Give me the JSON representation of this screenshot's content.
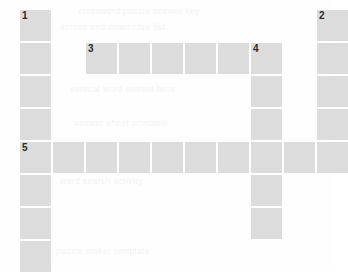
{
  "puzzle": {
    "title": "crossword-grid",
    "cell_fill_color": "#dcdcdc",
    "background_color": "#fefefe",
    "number_color": "#2b2b2b",
    "columns": 10,
    "rows": 8,
    "cell_size": 31,
    "cell_pitch": 33,
    "origin_x": 20,
    "origin_y": 10,
    "cells": [
      {
        "col": 0,
        "row": 0,
        "number": "1"
      },
      {
        "col": 9,
        "row": 0,
        "number": "2"
      },
      {
        "col": 0,
        "row": 1,
        "number": ""
      },
      {
        "col": 2,
        "row": 1,
        "number": "3"
      },
      {
        "col": 3,
        "row": 1,
        "number": ""
      },
      {
        "col": 4,
        "row": 1,
        "number": ""
      },
      {
        "col": 5,
        "row": 1,
        "number": ""
      },
      {
        "col": 6,
        "row": 1,
        "number": ""
      },
      {
        "col": 7,
        "row": 1,
        "number": "4"
      },
      {
        "col": 9,
        "row": 1,
        "number": ""
      },
      {
        "col": 0,
        "row": 2,
        "number": ""
      },
      {
        "col": 7,
        "row": 2,
        "number": ""
      },
      {
        "col": 9,
        "row": 2,
        "number": ""
      },
      {
        "col": 0,
        "row": 3,
        "number": ""
      },
      {
        "col": 7,
        "row": 3,
        "number": ""
      },
      {
        "col": 9,
        "row": 3,
        "number": ""
      },
      {
        "col": 0,
        "row": 4,
        "number": "5"
      },
      {
        "col": 1,
        "row": 4,
        "number": ""
      },
      {
        "col": 2,
        "row": 4,
        "number": ""
      },
      {
        "col": 3,
        "row": 4,
        "number": ""
      },
      {
        "col": 4,
        "row": 4,
        "number": ""
      },
      {
        "col": 5,
        "row": 4,
        "number": ""
      },
      {
        "col": 6,
        "row": 4,
        "number": ""
      },
      {
        "col": 7,
        "row": 4,
        "number": ""
      },
      {
        "col": 8,
        "row": 4,
        "number": ""
      },
      {
        "col": 9,
        "row": 4,
        "number": ""
      },
      {
        "col": 0,
        "row": 5,
        "number": ""
      },
      {
        "col": 7,
        "row": 5,
        "number": ""
      },
      {
        "col": 0,
        "row": 6,
        "number": ""
      },
      {
        "col": 7,
        "row": 6,
        "number": ""
      },
      {
        "col": 0,
        "row": 7,
        "number": ""
      }
    ]
  },
  "background_ghost_text": [
    {
      "text": "crossword puzzle answer key",
      "x": 78,
      "y": 6
    },
    {
      "text": "across and down clue list",
      "x": 60,
      "y": 22
    },
    {
      "text": "vertical word entries here",
      "x": 70,
      "y": 84
    },
    {
      "text": "answer sheet printable",
      "x": 74,
      "y": 118
    },
    {
      "text": "word search activity",
      "x": 60,
      "y": 176
    },
    {
      "text": "puzzle maker template",
      "x": 56,
      "y": 246
    }
  ]
}
